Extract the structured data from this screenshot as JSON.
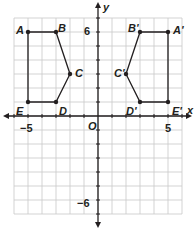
{
  "graph": {
    "x_axis_label": "x",
    "y_axis_label": "y",
    "origin_label": "O",
    "x_range": [
      -6,
      6
    ],
    "y_range": [
      -7,
      7
    ],
    "tick_labels": {
      "x_neg": "−5",
      "x_pos": "5",
      "y_pos": "6",
      "y_neg": "−6"
    },
    "colors": {
      "grid": "#c8c8c8",
      "axis": "#231f20",
      "shape": "#231f20"
    }
  },
  "figures": [
    {
      "name": "ABCDE",
      "vertices": [
        {
          "label": "A",
          "x": -5,
          "y": 6
        },
        {
          "label": "B",
          "x": -3,
          "y": 6
        },
        {
          "label": "C",
          "x": -2,
          "y": 3
        },
        {
          "label": "D",
          "x": -3,
          "y": 1
        },
        {
          "label": "E",
          "x": -5,
          "y": 1
        }
      ]
    },
    {
      "name": "A'B'C'D'E'",
      "vertices": [
        {
          "label": "A'",
          "x": 5,
          "y": 6
        },
        {
          "label": "B'",
          "x": 3,
          "y": 6
        },
        {
          "label": "C'",
          "x": 2,
          "y": 3
        },
        {
          "label": "D'",
          "x": 3,
          "y": 1
        },
        {
          "label": "E'",
          "x": 5,
          "y": 1
        }
      ]
    }
  ]
}
